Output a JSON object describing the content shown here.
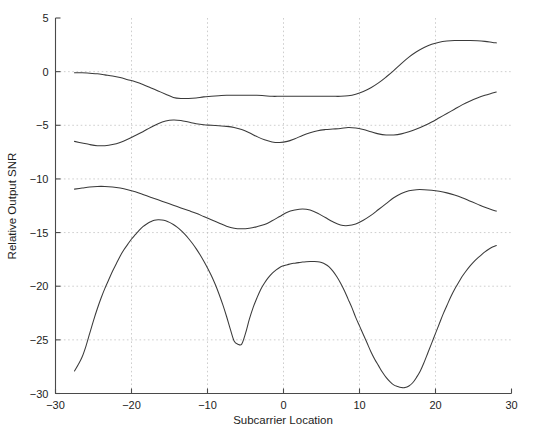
{
  "chart_data": {
    "type": "line",
    "title": "",
    "xlabel": "Subcarrier Location",
    "ylabel": "Relative Output SNR",
    "xlim": [
      -30,
      30
    ],
    "ylim": [
      -30,
      5
    ],
    "xticks": [
      -30,
      -20,
      -10,
      0,
      10,
      20,
      30
    ],
    "xticklabels": [
      "-30",
      "-20",
      "-10",
      "0",
      "10",
      "20",
      "30"
    ],
    "yticks": [
      5,
      0,
      -5,
      -10,
      -15,
      -20,
      -25,
      -30
    ],
    "yticklabels": [
      "5",
      "0",
      "-5",
      "-10",
      "-15",
      "-20",
      "-25",
      "-30"
    ],
    "grid": true,
    "grid_style": "dotted",
    "legend": null,
    "line_color": "#3a3a3a",
    "background_color": "#ffffff",
    "series": [
      {
        "name": "curve-1",
        "x": [
          -27.5,
          -26.5,
          -25.5,
          -24.5,
          -23.5,
          -22.5,
          -21.5,
          -20.5,
          -19.5,
          -18.5,
          -17.5,
          -16.5,
          -15.5,
          -14.5,
          -13.5,
          -12.5,
          -11.5,
          -10.5,
          -9.5,
          -8.5,
          -7.5,
          -6.5,
          -5.5,
          -4.5,
          -3.5,
          -2.5,
          -1.5,
          -0.5,
          0.5,
          1.5,
          2.5,
          3.5,
          4.5,
          5.5,
          6.5,
          7.5,
          8.5,
          9.5,
          10.5,
          11.5,
          12.5,
          13.5,
          14.5,
          15.5,
          16.5,
          17.5,
          18.5,
          19.5,
          20.5,
          21.5,
          22.5,
          23.5,
          24.5,
          25.5,
          26.5,
          27.5,
          28.0
        ],
        "y": [
          -0.1,
          -0.1,
          -0.15,
          -0.2,
          -0.3,
          -0.4,
          -0.55,
          -0.75,
          -0.95,
          -1.2,
          -1.5,
          -1.8,
          -2.1,
          -2.4,
          -2.5,
          -2.5,
          -2.45,
          -2.35,
          -2.3,
          -2.25,
          -2.2,
          -2.2,
          -2.2,
          -2.2,
          -2.2,
          -2.25,
          -2.3,
          -2.3,
          -2.3,
          -2.3,
          -2.3,
          -2.3,
          -2.3,
          -2.3,
          -2.3,
          -2.3,
          -2.25,
          -2.1,
          -1.85,
          -1.5,
          -1.05,
          -0.5,
          0.1,
          0.75,
          1.35,
          1.85,
          2.25,
          2.55,
          2.75,
          2.85,
          2.9,
          2.9,
          2.9,
          2.88,
          2.82,
          2.72,
          2.68
        ]
      },
      {
        "name": "curve-2",
        "x": [
          -27.5,
          -26.5,
          -25.5,
          -24.5,
          -23.5,
          -22.5,
          -21.5,
          -20.5,
          -19.5,
          -18.5,
          -17.5,
          -16.5,
          -15.5,
          -14.5,
          -13.5,
          -12.5,
          -11.5,
          -10.5,
          -9.5,
          -8.5,
          -7.5,
          -6.5,
          -5.5,
          -4.5,
          -3.5,
          -2.5,
          -1.5,
          -0.5,
          0.5,
          1.5,
          2.5,
          3.5,
          4.5,
          5.5,
          6.5,
          7.5,
          8.5,
          9.5,
          10.5,
          11.5,
          12.5,
          13.5,
          14.5,
          15.5,
          16.5,
          17.5,
          18.5,
          19.5,
          20.5,
          21.5,
          22.5,
          23.5,
          24.5,
          25.5,
          26.5,
          27.5,
          28.0
        ],
        "y": [
          -6.5,
          -6.65,
          -6.8,
          -6.9,
          -6.9,
          -6.8,
          -6.6,
          -6.3,
          -5.95,
          -5.6,
          -5.2,
          -4.85,
          -4.6,
          -4.5,
          -4.55,
          -4.7,
          -4.85,
          -4.95,
          -5.0,
          -5.05,
          -5.1,
          -5.2,
          -5.4,
          -5.7,
          -6.05,
          -6.35,
          -6.55,
          -6.6,
          -6.5,
          -6.25,
          -5.95,
          -5.7,
          -5.5,
          -5.4,
          -5.35,
          -5.3,
          -5.2,
          -5.25,
          -5.4,
          -5.6,
          -5.8,
          -5.9,
          -5.9,
          -5.8,
          -5.6,
          -5.35,
          -5.05,
          -4.7,
          -4.3,
          -3.9,
          -3.5,
          -3.1,
          -2.75,
          -2.45,
          -2.2,
          -2.0,
          -1.9
        ]
      },
      {
        "name": "curve-3",
        "x": [
          -27.5,
          -26.5,
          -25.5,
          -24.5,
          -23.5,
          -22.5,
          -21.5,
          -20.5,
          -19.5,
          -18.5,
          -17.5,
          -16.5,
          -15.5,
          -14.5,
          -13.5,
          -12.5,
          -11.5,
          -10.5,
          -9.5,
          -8.5,
          -7.5,
          -6.5,
          -5.5,
          -4.5,
          -3.5,
          -2.5,
          -1.5,
          -0.5,
          0.5,
          1.5,
          2.5,
          3.5,
          4.5,
          5.5,
          6.5,
          7.5,
          8.5,
          9.5,
          10.5,
          11.5,
          12.5,
          13.5,
          14.5,
          15.5,
          16.5,
          17.5,
          18.5,
          19.5,
          20.5,
          21.5,
          22.5,
          23.5,
          24.5,
          25.5,
          26.5,
          27.5,
          28.0
        ],
        "y": [
          -10.95,
          -10.85,
          -10.75,
          -10.7,
          -10.7,
          -10.75,
          -10.85,
          -11.0,
          -11.2,
          -11.45,
          -11.7,
          -11.95,
          -12.2,
          -12.45,
          -12.7,
          -12.95,
          -13.2,
          -13.5,
          -13.8,
          -14.1,
          -14.4,
          -14.6,
          -14.65,
          -14.6,
          -14.45,
          -14.25,
          -13.9,
          -13.5,
          -13.1,
          -12.9,
          -12.8,
          -12.9,
          -13.2,
          -13.6,
          -14.0,
          -14.3,
          -14.35,
          -14.2,
          -13.85,
          -13.4,
          -12.85,
          -12.3,
          -11.75,
          -11.35,
          -11.1,
          -11.0,
          -11.0,
          -11.05,
          -11.15,
          -11.3,
          -11.5,
          -11.75,
          -12.05,
          -12.35,
          -12.65,
          -12.9,
          -13.0
        ]
      },
      {
        "name": "curve-4",
        "x": [
          -27.5,
          -27.0,
          -26.5,
          -26.0,
          -25.5,
          -25.0,
          -24.5,
          -24.0,
          -23.5,
          -23.0,
          -22.5,
          -22.0,
          -21.5,
          -21.0,
          -20.5,
          -20.0,
          -19.5,
          -19.0,
          -18.5,
          -18.0,
          -17.5,
          -17.0,
          -16.5,
          -16.0,
          -15.5,
          -15.0,
          -14.5,
          -14.0,
          -13.5,
          -13.0,
          -12.5,
          -12.0,
          -11.5,
          -11.0,
          -10.5,
          -10.0,
          -9.5,
          -9.0,
          -8.5,
          -8.0,
          -7.5,
          -7.0,
          -6.5,
          -6.0,
          -5.5,
          -5.0,
          -4.5,
          -4.0,
          -3.5,
          -3.0,
          -2.5,
          -2.0,
          -1.5,
          -1.0,
          -0.5,
          0.0,
          0.5,
          1.0,
          1.5,
          2.0,
          2.5,
          3.0,
          3.5,
          4.0,
          4.5,
          5.0,
          5.5,
          6.0,
          6.5,
          7.0,
          7.5,
          8.0,
          8.5,
          9.0,
          9.5,
          10.0,
          10.5,
          11.0,
          11.5,
          12.0,
          12.5,
          13.0,
          13.5,
          14.0,
          14.5,
          15.0,
          15.5,
          16.0,
          16.5,
          17.0,
          17.5,
          18.0,
          18.5,
          19.0,
          19.5,
          20.0,
          20.5,
          21.0,
          21.5,
          22.0,
          22.5,
          23.0,
          23.5,
          24.0,
          24.5,
          25.0,
          25.5,
          26.0,
          26.5,
          27.0,
          27.5,
          28.0
        ],
        "y": [
          -27.9,
          -27.3,
          -26.6,
          -25.6,
          -24.4,
          -23.2,
          -22.1,
          -21.1,
          -20.2,
          -19.4,
          -18.6,
          -17.9,
          -17.2,
          -16.6,
          -16.1,
          -15.6,
          -15.2,
          -14.8,
          -14.45,
          -14.2,
          -14.0,
          -13.85,
          -13.8,
          -13.82,
          -13.9,
          -14.05,
          -14.25,
          -14.5,
          -14.8,
          -15.15,
          -15.55,
          -16.0,
          -16.5,
          -17.05,
          -17.65,
          -18.3,
          -19.0,
          -19.8,
          -20.7,
          -21.7,
          -22.8,
          -24.0,
          -25.1,
          -25.4,
          -25.4,
          -24.4,
          -23.1,
          -22.0,
          -21.1,
          -20.3,
          -19.7,
          -19.2,
          -18.8,
          -18.5,
          -18.25,
          -18.1,
          -18.0,
          -17.9,
          -17.85,
          -17.8,
          -17.75,
          -17.72,
          -17.7,
          -17.7,
          -17.72,
          -17.8,
          -17.95,
          -18.2,
          -18.6,
          -19.1,
          -19.7,
          -20.4,
          -21.2,
          -22.0,
          -22.9,
          -23.7,
          -24.5,
          -25.3,
          -26.1,
          -26.8,
          -27.4,
          -28.0,
          -28.5,
          -28.9,
          -29.2,
          -29.35,
          -29.45,
          -29.45,
          -29.3,
          -29.0,
          -28.5,
          -27.9,
          -27.1,
          -26.2,
          -25.3,
          -24.4,
          -23.5,
          -22.6,
          -21.8,
          -21.0,
          -20.3,
          -19.7,
          -19.1,
          -18.6,
          -18.15,
          -17.75,
          -17.4,
          -17.1,
          -16.8,
          -16.55,
          -16.35,
          -16.2
        ]
      }
    ]
  },
  "axis": {
    "xlabel": "Subcarrier Location",
    "ylabel": "Relative Output SNR"
  }
}
